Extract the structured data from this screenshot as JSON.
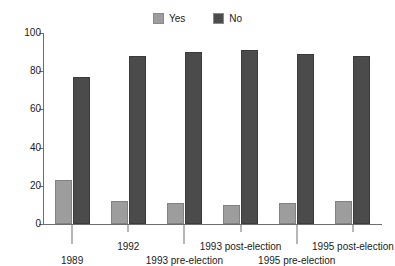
{
  "legend": {
    "position": "top-center",
    "entries": [
      {
        "label": "Yes",
        "color": "#9d9d9d",
        "icon": "square-swatch-icon"
      },
      {
        "label": "No",
        "color": "#4b4b4b",
        "icon": "square-swatch-icon"
      }
    ]
  },
  "axes": {
    "y": {
      "ticks": [
        "0",
        "20",
        "40",
        "60",
        "80",
        "100"
      ],
      "min": 0,
      "max": 100
    },
    "x": {
      "labels": [
        {
          "text": "1989",
          "row": "lower"
        },
        {
          "text": "1992",
          "row": "upper"
        },
        {
          "text": "1993 pre-election",
          "row": "lower"
        },
        {
          "text": "1993 post-election",
          "row": "upper"
        },
        {
          "text": "1995 pre-election",
          "row": "lower"
        },
        {
          "text": "1995 post-election",
          "row": "upper"
        }
      ]
    }
  },
  "chart_data": {
    "type": "bar",
    "title": "",
    "subtitle": "",
    "xlabel": "",
    "ylabel": "",
    "ylim": [
      0,
      100
    ],
    "yticks": [
      0,
      20,
      40,
      60,
      80,
      100
    ],
    "grid": false,
    "legend_position": "top-center",
    "categories": [
      "1989",
      "1992",
      "1993 pre-election",
      "1993 post-election",
      "1995 pre-election",
      "1995 post-election"
    ],
    "series": [
      {
        "name": "Yes",
        "color": "#9d9d9d",
        "values": [
          23,
          12,
          11,
          10,
          11,
          12
        ]
      },
      {
        "name": "No",
        "color": "#4b4b4b",
        "values": [
          77,
          88,
          90,
          91,
          89,
          88
        ]
      }
    ]
  }
}
